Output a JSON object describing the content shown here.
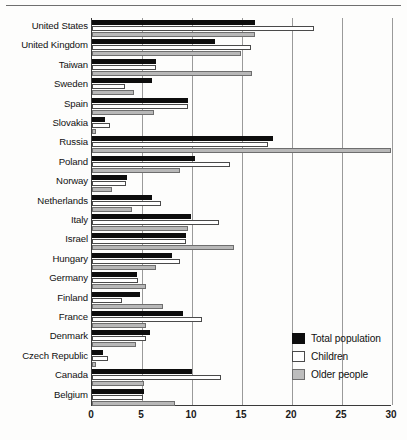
{
  "chart_data": {
    "type": "bar",
    "orientation": "horizontal",
    "title": "",
    "xlabel": "",
    "ylabel": "",
    "xlim": [
      0,
      30
    ],
    "xticks": [
      0,
      5,
      10,
      15,
      20,
      25,
      30
    ],
    "grid": "vertical",
    "legend_position": "bottom-right",
    "legend": [
      "Total population",
      "Children",
      "Older people"
    ],
    "series_colors": {
      "Total population": "#0d0d0d",
      "Children": "#ffffff",
      "Older people": "#bdbdbd"
    },
    "categories": [
      "United States",
      "United Kingdom",
      "Taiwan",
      "Sweden",
      "Spain",
      "Slovakia",
      "Russia",
      "Poland",
      "Norway",
      "Netherlands",
      "Italy",
      "Israel",
      "Hungary",
      "Germany",
      "Finland",
      "France",
      "Denmark",
      "Czech Republic",
      "Canada",
      "Belgium"
    ],
    "series": [
      {
        "name": "Total population",
        "values": [
          16.3,
          12.3,
          6.4,
          6.0,
          9.6,
          1.3,
          18.1,
          10.3,
          3.5,
          6.0,
          9.9,
          9.4,
          8.0,
          4.5,
          4.8,
          9.1,
          5.8,
          1.1,
          10.0,
          5.2
        ]
      },
      {
        "name": "Children",
        "values": [
          22.2,
          15.9,
          6.4,
          3.3,
          9.6,
          1.8,
          17.6,
          13.8,
          3.4,
          6.9,
          12.7,
          9.4,
          8.8,
          4.6,
          3.0,
          11.0,
          5.4,
          1.6,
          12.9,
          5.1
        ]
      },
      {
        "name": "Older people",
        "values": [
          16.3,
          14.9,
          16.0,
          4.2,
          6.2,
          0.4,
          29.9,
          8.8,
          2.0,
          4.0,
          9.6,
          14.2,
          6.4,
          5.4,
          7.1,
          5.4,
          4.4,
          0.4,
          5.2,
          8.3
        ]
      }
    ]
  },
  "axis": {
    "ticks": [
      "0",
      "5",
      "10",
      "15",
      "20",
      "25",
      "30"
    ]
  },
  "legend": {
    "items": [
      {
        "label": "Total population",
        "swatch": "total"
      },
      {
        "label": "Children",
        "swatch": "children"
      },
      {
        "label": "Older people",
        "swatch": "older"
      }
    ]
  }
}
